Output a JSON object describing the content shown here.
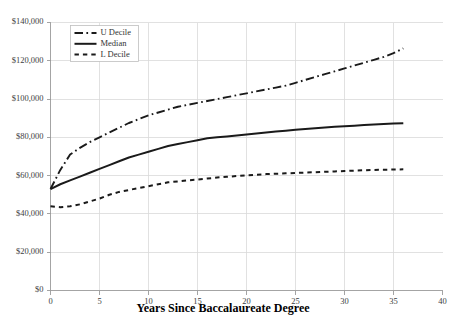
{
  "chart_data": {
    "type": "line",
    "title": "",
    "xlabel": "Years Since Baccalaureate Degree",
    "ylabel": "",
    "xlim": [
      0,
      40
    ],
    "ylim": [
      0,
      140000
    ],
    "grid": true,
    "legend_position": "top-left",
    "x_ticks": [
      "0",
      "5",
      "10",
      "15",
      "20",
      "25",
      "30",
      "35",
      "40"
    ],
    "x_tick_values": [
      0,
      5,
      10,
      15,
      20,
      25,
      30,
      35,
      40
    ],
    "y_ticks": [
      "$0",
      "$20,000",
      "$40,000",
      "$60,000",
      "$80,000",
      "$100,000",
      "$120,000",
      "$140,000"
    ],
    "y_tick_values": [
      0,
      20000,
      40000,
      60000,
      80000,
      100000,
      120000,
      140000
    ],
    "x": [
      0,
      1,
      2,
      3,
      4,
      5,
      6,
      7,
      8,
      9,
      10,
      11,
      12,
      13,
      14,
      15,
      16,
      17,
      18,
      19,
      20,
      21,
      22,
      23,
      24,
      25,
      26,
      27,
      28,
      29,
      30,
      31,
      32,
      33,
      34,
      35,
      36
    ],
    "series": [
      {
        "name": "U Decile",
        "style": "dashdot",
        "color": "#1a1a1a",
        "width": 1.9,
        "values": [
          53000,
          63000,
          71000,
          74500,
          77500,
          80000,
          82500,
          85000,
          87500,
          89500,
          91500,
          93000,
          94500,
          96000,
          97000,
          98000,
          99000,
          100000,
          101000,
          102000,
          103000,
          104000,
          105000,
          106000,
          107000,
          108500,
          110000,
          111500,
          113000,
          114500,
          116000,
          117500,
          119000,
          120500,
          122000,
          124000,
          126500
        ]
      },
      {
        "name": "Median",
        "style": "solid",
        "color": "#1a1a1a",
        "width": 2.0,
        "values": [
          53000,
          55500,
          57500,
          59500,
          61500,
          63500,
          65500,
          67500,
          69500,
          71000,
          72500,
          74000,
          75500,
          76500,
          77500,
          78500,
          79500,
          80000,
          80500,
          81000,
          81500,
          82000,
          82500,
          83000,
          83500,
          84000,
          84400,
          84800,
          85200,
          85500,
          85800,
          86100,
          86400,
          86700,
          87000,
          87200,
          87400
        ]
      },
      {
        "name": "L Decile",
        "style": "dashed",
        "color": "#1a1a1a",
        "width": 2.0,
        "values": [
          44000,
          43500,
          44000,
          45000,
          46500,
          48000,
          50000,
          51500,
          52500,
          53500,
          54500,
          55500,
          56500,
          57000,
          57500,
          58000,
          58500,
          59000,
          59400,
          59800,
          60200,
          60500,
          60800,
          61000,
          61200,
          61400,
          61600,
          61800,
          62000,
          62200,
          62400,
          62600,
          62800,
          63000,
          63100,
          63200,
          63300
        ]
      }
    ],
    "legend_entries": [
      {
        "label": "U Decile",
        "style": "dashdot"
      },
      {
        "label": "Median",
        "style": "solid"
      },
      {
        "label": "L Decile",
        "style": "dashed"
      }
    ]
  }
}
